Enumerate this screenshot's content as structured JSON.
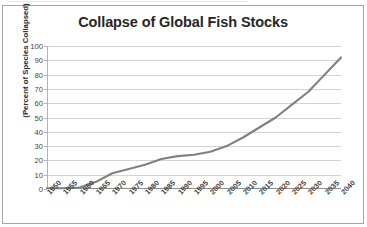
{
  "chart_data": {
    "type": "line",
    "title": "Collapse of Global Fish Stocks",
    "xlabel": "",
    "ylabel": "(Percent of Species Collapsed)",
    "categories": [
      "1950",
      "1955",
      "1960",
      "1965",
      "1970",
      "1975",
      "1980",
      "1985",
      "1990",
      "1995",
      "2000",
      "2005",
      "2010",
      "2015",
      "2020",
      "2025",
      "2030",
      "2035",
      "2040"
    ],
    "values": [
      0.5,
      0.5,
      1,
      5,
      11,
      14,
      17,
      21,
      23,
      24,
      26,
      30,
      36,
      43,
      50,
      59,
      68,
      80,
      92
    ],
    "series": [
      {
        "name": "Percent of Species Collapsed",
        "values": [
          0.5,
          0.5,
          1,
          5,
          11,
          14,
          17,
          21,
          23,
          24,
          26,
          30,
          36,
          43,
          50,
          59,
          68,
          80,
          92
        ]
      }
    ],
    "ylim": [
      0,
      100
    ],
    "ytick_step": 10,
    "yticks": [
      "100",
      "90",
      "80",
      "70",
      "60",
      "50",
      "40",
      "30",
      "20",
      "10",
      "0"
    ],
    "grid": "horizontal",
    "legend": "none",
    "line_color": "#808080",
    "grid_color": "#d4d4d4",
    "axis_color": "#8c8c8c",
    "title_color": "#262626",
    "background": "#ffffff",
    "border_color": "#a6a6a6"
  }
}
